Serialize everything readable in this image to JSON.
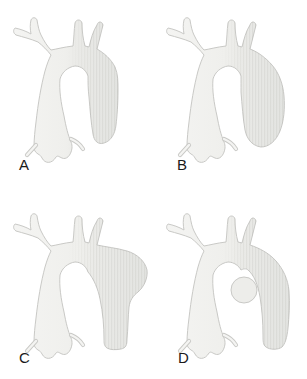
{
  "figure": {
    "kind": "medical-illustration"
  },
  "panels": [
    {
      "label": "A",
      "shape": "aortic-arch-normal"
    },
    {
      "label": "B",
      "shape": "aortic-arch-dilated-descending"
    },
    {
      "label": "C",
      "shape": "aortic-arch-bulge-proximal-descending"
    },
    {
      "label": "D",
      "shape": "aortic-arch-round-knob-inner"
    }
  ],
  "colors": {
    "background": "#ffffff",
    "fill_light": "#f4f4f2",
    "fill_mid": "#efefec",
    "fill_dark": "#e3e4e1",
    "knob_fill": "#ededea",
    "outline": "#c9c9c6",
    "label_text": "#1a1a1a"
  }
}
